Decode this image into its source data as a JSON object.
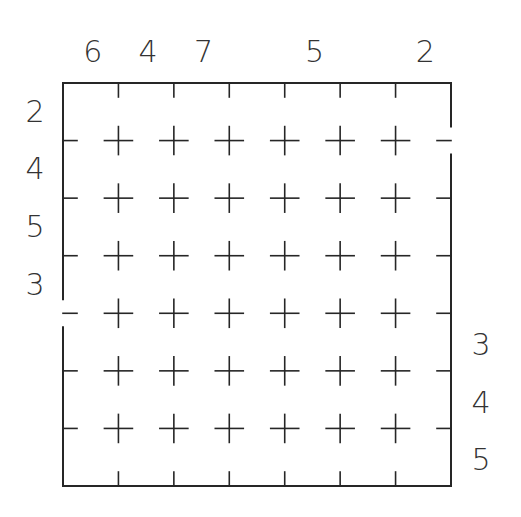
{
  "puzzle": {
    "rows": 7,
    "cols": 7,
    "line_color": "#262626",
    "text_color": "#333333",
    "background": "#ffffff",
    "clues": {
      "top": [
        "6",
        "4",
        "7",
        "",
        "5",
        "",
        "2"
      ],
      "left": [
        "2",
        "4",
        "5",
        "3",
        "",
        "",
        ""
      ],
      "right": [
        "",
        "",
        "",
        "",
        "3",
        "4",
        "5"
      ],
      "bottom": [
        "",
        "",
        "",
        "",
        "",
        "",
        ""
      ]
    },
    "border_gaps": {
      "left": [
        4
      ],
      "right": [
        1
      ]
    }
  }
}
